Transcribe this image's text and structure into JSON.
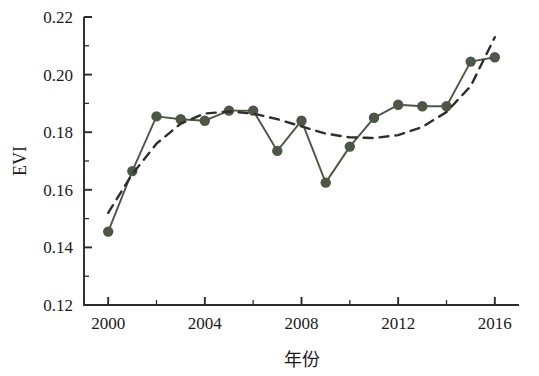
{
  "chart_data": {
    "type": "line",
    "title": "",
    "xlabel": "年份",
    "ylabel": "EVI",
    "xlim": [
      1999,
      2017
    ],
    "ylim": [
      0.12,
      0.22
    ],
    "grid": false,
    "legend": "none",
    "x": [
      2000,
      2001,
      2002,
      2003,
      2004,
      2005,
      2006,
      2007,
      2008,
      2009,
      2010,
      2011,
      2012,
      2013,
      2014,
      2015,
      2016
    ],
    "xticks": [
      2000,
      2004,
      2008,
      2012,
      2016
    ],
    "xtick_labels": [
      "2000",
      "2004",
      "2008",
      "2012",
      "2016"
    ],
    "x_minor_ticks": [
      2002,
      2006,
      2010,
      2014
    ],
    "yticks": [
      0.12,
      0.14,
      0.16,
      0.18,
      0.2,
      0.22
    ],
    "ytick_labels": [
      "0.12",
      "0.14",
      "0.16",
      "0.18",
      "0.20",
      "0.22"
    ],
    "y_minor_ticks": [
      0.13,
      0.15,
      0.17,
      0.19,
      0.21
    ],
    "series": [
      {
        "name": "EVI",
        "style": "solid-with-markers",
        "color": "#4c5746",
        "marker": "circle",
        "values": [
          0.1455,
          0.1665,
          0.1855,
          0.1845,
          0.184,
          0.1875,
          0.1875,
          0.1735,
          0.184,
          0.1625,
          0.175,
          0.185,
          0.1895,
          0.189,
          0.189,
          0.2045,
          0.206
        ]
      },
      {
        "name": "趋势线",
        "style": "dashed",
        "color": "#2e2e2e",
        "marker": "none",
        "values": [
          0.152,
          0.1655,
          0.176,
          0.183,
          0.1865,
          0.1872,
          0.1865,
          0.1845,
          0.182,
          0.1795,
          0.1782,
          0.178,
          0.179,
          0.1818,
          0.187,
          0.196,
          0.213
        ]
      }
    ]
  }
}
